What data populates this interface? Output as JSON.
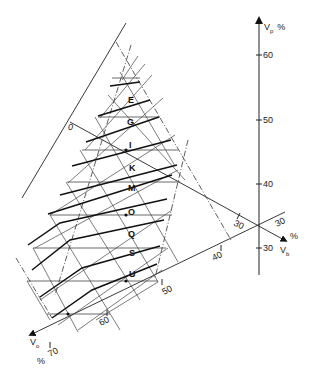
{
  "diagram": {
    "type": "ternary-nomogram",
    "axes": {
      "vp": {
        "label": "V",
        "subscript": "p",
        "unit": "%",
        "ticks": [
          "60",
          "50",
          "40",
          "30"
        ]
      },
      "vb": {
        "label": "V",
        "subscript": "b",
        "unit": "%",
        "ticks": [
          "30",
          "30"
        ]
      },
      "vo": {
        "label": "V",
        "subscript": "o",
        "unit": "%",
        "ticks": [
          "40",
          "50",
          "60",
          "70"
        ]
      }
    },
    "zero_line_label": "0",
    "row_labels": [
      "E",
      "G",
      "I",
      "K",
      "M",
      "O",
      "Q",
      "S",
      "U"
    ],
    "colors": {
      "line": "#222222",
      "grid": "#444444",
      "background": "#ffffff"
    }
  }
}
